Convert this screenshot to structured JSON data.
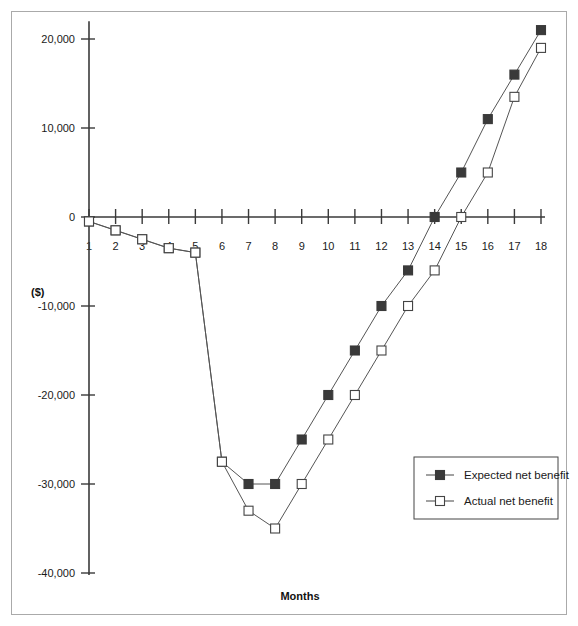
{
  "chart_data": {
    "type": "line",
    "title": "",
    "xlabel": "Months",
    "ylabel": "($)",
    "x": [
      1,
      2,
      3,
      4,
      5,
      6,
      7,
      8,
      9,
      10,
      11,
      12,
      13,
      14,
      15,
      16,
      17,
      18
    ],
    "xtick_labels": [
      "1",
      "2",
      "3",
      "4",
      "5",
      "6",
      "7",
      "8",
      "9",
      "10",
      "11",
      "12",
      "13",
      "14",
      "15",
      "16",
      "17",
      "18"
    ],
    "ytick_labels": [
      "20,000",
      "10,000",
      "0",
      "-10,000",
      "-20,000",
      "-30,000",
      "-40,000"
    ],
    "ytick_values": [
      20000,
      10000,
      0,
      -10000,
      -20000,
      -30000,
      -40000
    ],
    "ylim": [
      -40000,
      22000
    ],
    "xlim": [
      0.4,
      18.6
    ],
    "grid": false,
    "legend_position": "lower-right",
    "series": [
      {
        "name": "Expected net benefit",
        "marker": "filled-square",
        "color": "#3a3a3a",
        "values": [
          -500,
          -1500,
          -2500,
          -3500,
          -4000,
          -27500,
          -30000,
          -30000,
          -25000,
          -20000,
          -15000,
          -10000,
          -6000,
          0,
          5000,
          11000,
          16000,
          21000
        ]
      },
      {
        "name": "Actual net benefit",
        "marker": "open-square",
        "color": "#ffffff",
        "values": [
          -500,
          -1500,
          -2500,
          -3500,
          -4000,
          -27500,
          -33000,
          -35000,
          -30000,
          -25000,
          -20000,
          -15000,
          -10000,
          -6000,
          0,
          5000,
          13500,
          19000
        ]
      }
    ]
  },
  "legend": {
    "items": [
      {
        "label": "Expected net benefit",
        "marker": "filled-square"
      },
      {
        "label": "Actual net benefit",
        "marker": "open-square"
      }
    ]
  },
  "axes": {
    "y_title": "($)",
    "x_title": "Months"
  }
}
